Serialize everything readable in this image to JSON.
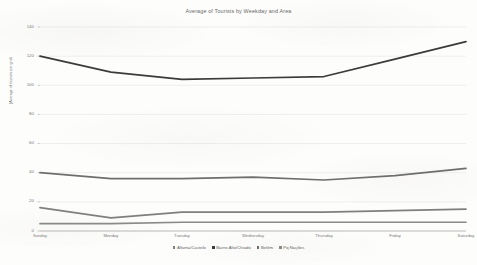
{
  "chart_data": {
    "type": "line",
    "title": "Average of Tourists by Weekday and Area",
    "xlabel": "",
    "ylabel": "(Average of tourists per grid)",
    "categories": [
      "Sunday",
      "Monday",
      "Tuesday",
      "Wednesday",
      "Thursday",
      "Friday",
      "Saturday"
    ],
    "ylim": [
      0,
      140
    ],
    "yticks": [
      0,
      20,
      40,
      60,
      80,
      100,
      120,
      140
    ],
    "grid": true,
    "legend_position": "bottom",
    "series": [
      {
        "name": "Alfama/Castelo",
        "color": "#7f7f7f",
        "values": [
          16,
          9,
          13,
          13,
          13,
          14,
          15
        ]
      },
      {
        "name": "Bairro Alto/Chiado",
        "color": "#3b3b3b",
        "values": [
          120,
          109,
          104,
          105,
          106,
          118,
          130
        ]
      },
      {
        "name": "Belém",
        "color": "#6e6e6e",
        "values": [
          40,
          36,
          36,
          37,
          35,
          38,
          43
        ]
      },
      {
        "name": "Pq Nações",
        "color": "#8a8a8a",
        "values": [
          5,
          5,
          6,
          6,
          6,
          6,
          6
        ]
      }
    ]
  },
  "axis": {
    "y_tick_labels": [
      "140",
      "120",
      "100",
      "80",
      "60",
      "40",
      "20",
      "0"
    ]
  },
  "legend": {
    "items": [
      {
        "label": "Alfama/Castelo",
        "color": "#7f7f7f"
      },
      {
        "label": "Bairro Alto/Chiado",
        "color": "#3b3b3b"
      },
      {
        "label": "Belém",
        "color": "#6e6e6e"
      },
      {
        "label": "Pq Nações",
        "color": "#8a8a8a"
      }
    ]
  }
}
